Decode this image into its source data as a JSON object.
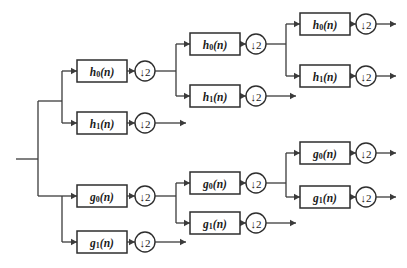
{
  "diagram": {
    "type": "block-diagram",
    "canvas": {
      "width": 407,
      "height": 268
    },
    "colors": {
      "background": "#ffffff",
      "line": "#3b3b3b",
      "box_stroke": "#2e2e2e",
      "box_fill": "#ffffff",
      "text": "#1a1a1a"
    },
    "labels": {
      "h0": "h",
      "h0_sub": "0",
      "h0_arg": "(n)",
      "h1": "h",
      "h1_sub": "1",
      "h1_arg": "(n)",
      "g0": "g",
      "g0_sub": "0",
      "g0_arg": "(n)",
      "g1": "g",
      "g1_sub": "1",
      "g1_arg": "(n)",
      "downsample": "↓2"
    },
    "input": {
      "name": "input-signal-line",
      "x1": 16,
      "y1": 159,
      "x2": 38,
      "y2": 159
    },
    "filters": [
      {
        "id": "s1-h0",
        "base": "h",
        "sub": "0",
        "arg": "(n)",
        "x": 77,
        "y": 60,
        "w": 50,
        "h": 22,
        "stage": 1,
        "branch": "h"
      },
      {
        "id": "s1-h1",
        "base": "h",
        "sub": "1",
        "arg": "(n)",
        "x": 77,
        "y": 112,
        "w": 50,
        "h": 22,
        "stage": 1,
        "branch": "h"
      },
      {
        "id": "s1-g0",
        "base": "g",
        "sub": "0",
        "arg": "(n)",
        "x": 77,
        "y": 185,
        "w": 50,
        "h": 22,
        "stage": 1,
        "branch": "g"
      },
      {
        "id": "s1-g1",
        "base": "g",
        "sub": "1",
        "arg": "(n)",
        "x": 77,
        "y": 231,
        "w": 50,
        "h": 22,
        "stage": 1,
        "branch": "g"
      },
      {
        "id": "s2-h0",
        "base": "h",
        "sub": "0",
        "arg": "(n)",
        "x": 190,
        "y": 33,
        "w": 50,
        "h": 22,
        "stage": 2,
        "branch": "h"
      },
      {
        "id": "s2-h1",
        "base": "h",
        "sub": "1",
        "arg": "(n)",
        "x": 190,
        "y": 85,
        "w": 50,
        "h": 22,
        "stage": 2,
        "branch": "h"
      },
      {
        "id": "s2-g0",
        "base": "g",
        "sub": "0",
        "arg": "(n)",
        "x": 190,
        "y": 172,
        "w": 50,
        "h": 22,
        "stage": 2,
        "branch": "g"
      },
      {
        "id": "s2-g1",
        "base": "g",
        "sub": "1",
        "arg": "(n)",
        "x": 190,
        "y": 212,
        "w": 50,
        "h": 22,
        "stage": 2,
        "branch": "g"
      },
      {
        "id": "s3-h0",
        "base": "h",
        "sub": "0",
        "arg": "(n)",
        "x": 300,
        "y": 13,
        "w": 50,
        "h": 22,
        "stage": 3,
        "branch": "h"
      },
      {
        "id": "s3-h1",
        "base": "h",
        "sub": "1",
        "arg": "(n)",
        "x": 300,
        "y": 65,
        "w": 50,
        "h": 22,
        "stage": 3,
        "branch": "h"
      },
      {
        "id": "s3-g0",
        "base": "g",
        "sub": "0",
        "arg": "(n)",
        "x": 300,
        "y": 142,
        "w": 50,
        "h": 22,
        "stage": 3,
        "branch": "g"
      },
      {
        "id": "s3-g1",
        "base": "g",
        "sub": "1",
        "arg": "(n)",
        "x": 300,
        "y": 186,
        "w": 50,
        "h": 22,
        "stage": 3,
        "branch": "g"
      }
    ],
    "downsamplers": [
      {
        "id": "d-s1-h0",
        "label": "↓2",
        "cx": 145,
        "cy": 71,
        "r": 10
      },
      {
        "id": "d-s1-h1",
        "label": "↓2",
        "cx": 145,
        "cy": 123,
        "r": 10
      },
      {
        "id": "d-s1-g0",
        "label": "↓2",
        "cx": 145,
        "cy": 196,
        "r": 10
      },
      {
        "id": "d-s1-g1",
        "label": "↓2",
        "cx": 145,
        "cy": 242,
        "r": 10
      },
      {
        "id": "d-s2-h0",
        "label": "↓2",
        "cx": 256,
        "cy": 44,
        "r": 10
      },
      {
        "id": "d-s2-h1",
        "label": "↓2",
        "cx": 256,
        "cy": 96,
        "r": 10
      },
      {
        "id": "d-s2-g0",
        "label": "↓2",
        "cx": 256,
        "cy": 183,
        "r": 10
      },
      {
        "id": "d-s2-g1",
        "label": "↓2",
        "cx": 256,
        "cy": 223,
        "r": 10
      },
      {
        "id": "d-s3-h0",
        "label": "↓2",
        "cx": 366,
        "cy": 24,
        "r": 10
      },
      {
        "id": "d-s3-h1",
        "label": "↓2",
        "cx": 366,
        "cy": 76,
        "r": 10
      },
      {
        "id": "d-s3-g0",
        "label": "↓2",
        "cx": 366,
        "cy": 153,
        "r": 10
      },
      {
        "id": "d-s3-g1",
        "label": "↓2",
        "cx": 366,
        "cy": 197,
        "r": 10
      }
    ],
    "wires": [
      {
        "id": "w-input",
        "d": "M16,159 L38,159"
      },
      {
        "id": "w-trunk",
        "d": "M38,101 L38,196"
      },
      {
        "id": "w-trunk-top",
        "d": "M38,101 L62,101"
      },
      {
        "id": "w-trunk-bot",
        "d": "M38,196 L62,196"
      },
      {
        "id": "w-s1h-split",
        "d": "M62,71 L62,123"
      },
      {
        "id": "w-s1h0-in",
        "d": "M62,71 L77,71"
      },
      {
        "id": "w-s1h1-in",
        "d": "M62,123 L77,123"
      },
      {
        "id": "w-s1g-split",
        "d": "M62,196 L62,242"
      },
      {
        "id": "w-s1g0-in",
        "d": "M62,196 L77,196"
      },
      {
        "id": "w-s1g1-in",
        "d": "M62,242 L77,242"
      },
      {
        "id": "w-s1h0-out",
        "d": "M127,71 L135,71"
      },
      {
        "id": "w-s1h1-out",
        "d": "M127,123 L135,123"
      },
      {
        "id": "w-s1g0-out",
        "d": "M127,196 L135,196"
      },
      {
        "id": "w-s1g1-out",
        "d": "M127,242 L135,242"
      },
      {
        "id": "w-s1h0-post",
        "d": "M155,71 L176,71"
      },
      {
        "id": "w-s1h1-post",
        "d": "M155,123 L186,123"
      },
      {
        "id": "w-s1g0-post",
        "d": "M155,196 L176,196"
      },
      {
        "id": "w-s1g1-post",
        "d": "M155,242 L186,242"
      },
      {
        "id": "w-s2h-split",
        "d": "M176,44 L176,96"
      },
      {
        "id": "w-s2h0-in",
        "d": "M176,44 L190,44"
      },
      {
        "id": "w-s2h1-in",
        "d": "M176,96 L190,96"
      },
      {
        "id": "w-s2g-split",
        "d": "M176,183 L176,223"
      },
      {
        "id": "w-s2g0-in",
        "d": "M176,183 L190,183"
      },
      {
        "id": "w-s2g1-in",
        "d": "M176,223 L190,223"
      },
      {
        "id": "w-s2h0-out",
        "d": "M240,44 L246,44"
      },
      {
        "id": "w-s2h1-out",
        "d": "M240,96 L246,96"
      },
      {
        "id": "w-s2g0-out",
        "d": "M240,183 L246,183"
      },
      {
        "id": "w-s2g1-out",
        "d": "M240,223 L246,223"
      },
      {
        "id": "w-s2h0-post",
        "d": "M266,44 L286,44"
      },
      {
        "id": "w-s2h1-post",
        "d": "M266,96 L296,96"
      },
      {
        "id": "w-s2g0-post",
        "d": "M266,183 L286,183"
      },
      {
        "id": "w-s2g1-post",
        "d": "M266,223 L296,223"
      },
      {
        "id": "w-s3h-split",
        "d": "M286,24 L286,76"
      },
      {
        "id": "w-s3h0-in",
        "d": "M286,24 L300,24"
      },
      {
        "id": "w-s3h1-in",
        "d": "M286,76 L300,76"
      },
      {
        "id": "w-s3g-split",
        "d": "M286,153 L286,197"
      },
      {
        "id": "w-s3g0-in",
        "d": "M286,153 L300,153"
      },
      {
        "id": "w-s3g1-in",
        "d": "M286,197 L300,197"
      },
      {
        "id": "w-s3h0-out",
        "d": "M350,24 L356,24"
      },
      {
        "id": "w-s3h1-out",
        "d": "M350,76 L356,76"
      },
      {
        "id": "w-s3g0-out",
        "d": "M350,153 L356,153"
      },
      {
        "id": "w-s3g1-out",
        "d": "M350,197 L356,197"
      },
      {
        "id": "w-s3h0-term",
        "d": "M376,24 L396,24"
      },
      {
        "id": "w-s3h1-term",
        "d": "M376,76 L396,76"
      },
      {
        "id": "w-s3g0-term",
        "d": "M376,153 L396,153"
      },
      {
        "id": "w-s3g1-term",
        "d": "M376,197 L396,197"
      }
    ],
    "arrowheads": [
      {
        "id": "a-s1h0-in",
        "x": 77,
        "y": 71
      },
      {
        "id": "a-s1h1-in",
        "x": 77,
        "y": 123
      },
      {
        "id": "a-s1g0-in",
        "x": 77,
        "y": 196
      },
      {
        "id": "a-s1g1-in",
        "x": 77,
        "y": 242
      },
      {
        "id": "a-s1h0-ds",
        "x": 135,
        "y": 71
      },
      {
        "id": "a-s1h1-ds",
        "x": 135,
        "y": 123
      },
      {
        "id": "a-s1g0-ds",
        "x": 135,
        "y": 196
      },
      {
        "id": "a-s1g1-ds",
        "x": 135,
        "y": 242
      },
      {
        "id": "a-s1h1-term",
        "x": 186,
        "y": 123
      },
      {
        "id": "a-s1g1-term",
        "x": 186,
        "y": 242
      },
      {
        "id": "a-s2h0-in",
        "x": 190,
        "y": 44
      },
      {
        "id": "a-s2h1-in",
        "x": 190,
        "y": 96
      },
      {
        "id": "a-s2g0-in",
        "x": 190,
        "y": 183
      },
      {
        "id": "a-s2g1-in",
        "x": 190,
        "y": 223
      },
      {
        "id": "a-s2h0-ds",
        "x": 246,
        "y": 44
      },
      {
        "id": "a-s2h1-ds",
        "x": 246,
        "y": 96
      },
      {
        "id": "a-s2g0-ds",
        "x": 246,
        "y": 183
      },
      {
        "id": "a-s2g1-ds",
        "x": 246,
        "y": 223
      },
      {
        "id": "a-s2h1-term",
        "x": 296,
        "y": 96
      },
      {
        "id": "a-s2g1-term",
        "x": 296,
        "y": 223
      },
      {
        "id": "a-s3h0-in",
        "x": 300,
        "y": 24
      },
      {
        "id": "a-s3h1-in",
        "x": 300,
        "y": 76
      },
      {
        "id": "a-s3g0-in",
        "x": 300,
        "y": 153
      },
      {
        "id": "a-s3g1-in",
        "x": 300,
        "y": 197
      },
      {
        "id": "a-s3h0-ds",
        "x": 356,
        "y": 24
      },
      {
        "id": "a-s3h1-ds",
        "x": 356,
        "y": 76
      },
      {
        "id": "a-s3g0-ds",
        "x": 356,
        "y": 153
      },
      {
        "id": "a-s3g1-ds",
        "x": 356,
        "y": 197
      },
      {
        "id": "a-s3h0-term",
        "x": 396,
        "y": 24
      },
      {
        "id": "a-s3h1-term",
        "x": 396,
        "y": 76
      },
      {
        "id": "a-s3g0-term",
        "x": 396,
        "y": 153
      },
      {
        "id": "a-s3g1-term",
        "x": 396,
        "y": 197
      }
    ]
  }
}
